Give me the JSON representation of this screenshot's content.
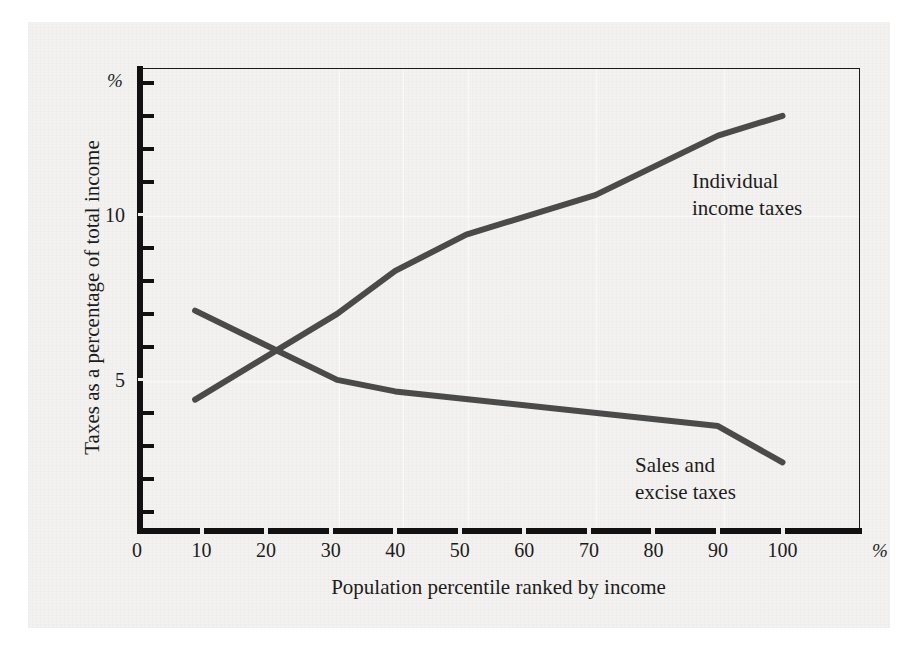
{
  "figure": {
    "y_axis_unit_symbol": "%",
    "x_axis_unit_symbol": "%",
    "y_axis_title": "Taxes as a percentage of total income",
    "x_axis_title": "Population percentile ranked by income",
    "annotation_income": "Individual\nincome taxes",
    "annotation_sales": "Sales and\nexcise taxes",
    "line_color": "#4a4a4a",
    "axis_color": "#111111",
    "plate_color": "#f3f2f0"
  },
  "chart_data": {
    "type": "line",
    "title": "",
    "subtitle": "",
    "xlabel": "Population percentile ranked by income",
    "ylabel": "Taxes as a percentage of total income",
    "xlim": [
      0,
      112
    ],
    "ylim": [
      0.45,
      14.45
    ],
    "xticks": [
      0,
      10,
      20,
      30,
      40,
      50,
      60,
      70,
      80,
      90,
      100
    ],
    "xtick_labels": [
      "0",
      "10",
      "20",
      "30",
      "40",
      "50",
      "60",
      "70",
      "80",
      "90",
      "100"
    ],
    "yticks": [
      1,
      2,
      3,
      4,
      5,
      6,
      7,
      8,
      9,
      10,
      11,
      12,
      13,
      14
    ],
    "ytick_labels_shown": {
      "5": "5",
      "10": "10"
    },
    "grid": false,
    "legend": "in-plot annotations",
    "x_unit": "%",
    "y_unit": "%",
    "series": [
      {
        "name": "Individual income taxes",
        "x": [
          9,
          31,
          40,
          51,
          71,
          90,
          100
        ],
        "values": [
          4.4,
          7.0,
          8.3,
          9.4,
          10.6,
          12.4,
          13.0
        ]
      },
      {
        "name": "Sales and excise taxes",
        "x": [
          9,
          31,
          40,
          90,
          100
        ],
        "values": [
          7.1,
          5.0,
          4.65,
          3.6,
          2.5
        ]
      }
    ]
  }
}
